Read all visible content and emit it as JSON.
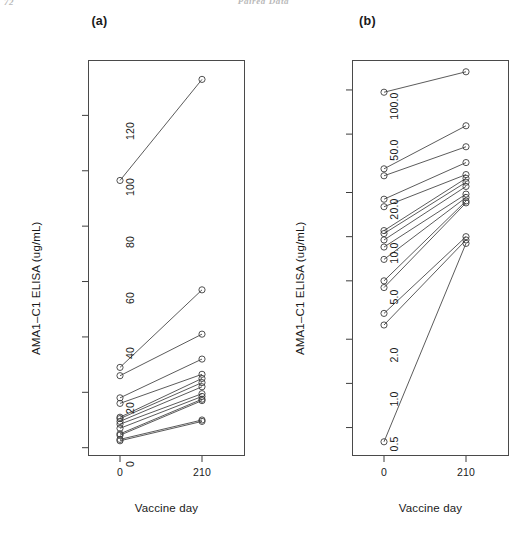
{
  "page_header": {
    "left": "72",
    "center": "Paired Data"
  },
  "figure": {
    "panels": [
      {
        "key": "a",
        "label": "(a)",
        "xlabel": "Vaccine day",
        "ylabel": "AMA1–C1 ELISA (ug/mL)",
        "yscale": "linear",
        "yticks": [
          "0",
          "20",
          "40",
          "60",
          "80",
          "100",
          "120"
        ],
        "xticks": [
          "0",
          "210"
        ]
      },
      {
        "key": "b",
        "label": "(b)",
        "xlabel": "Vaccine day",
        "ylabel": "AMA1–C1 ELISA (ug/mL)",
        "yscale": "log",
        "yticks": [
          "0.5",
          "1.0",
          "2.0",
          "5.0",
          "10.0",
          "20.0",
          "50.0",
          "100.0"
        ],
        "xticks": [
          "0",
          "210"
        ]
      }
    ]
  },
  "chart_data": [
    {
      "type": "line",
      "title": "(a)",
      "subtitle": "",
      "xlabel": "Vaccine day",
      "ylabel": "AMA1-C1 ELISA (ug/mL)",
      "x": [
        0,
        210
      ],
      "xtick_labels": [
        "0",
        "210"
      ],
      "ytick_values": [
        0,
        20,
        40,
        60,
        80,
        100,
        120
      ],
      "ytick_labels": [
        "0",
        "20",
        "40",
        "60",
        "80",
        "100",
        "120"
      ],
      "ylim": [
        -3,
        140
      ],
      "yscale": "linear",
      "grid": false,
      "legend": "none",
      "marker": "open-circle",
      "series": [
        {
          "name": "subject-1",
          "values": [
            96.5,
            133.0
          ]
        },
        {
          "name": "subject-2",
          "values": [
            29.0,
            57.0
          ]
        },
        {
          "name": "subject-3",
          "values": [
            26.0,
            41.0
          ]
        },
        {
          "name": "subject-4",
          "values": [
            18.0,
            32.0
          ]
        },
        {
          "name": "subject-5",
          "values": [
            16.0,
            26.5
          ]
        },
        {
          "name": "subject-6",
          "values": [
            11.0,
            25.0
          ]
        },
        {
          "name": "subject-7",
          "values": [
            10.5,
            23.5
          ]
        },
        {
          "name": "subject-8",
          "values": [
            9.5,
            22.0
          ]
        },
        {
          "name": "subject-9",
          "values": [
            8.5,
            19.5
          ]
        },
        {
          "name": "subject-10",
          "values": [
            7.0,
            18.5
          ]
        },
        {
          "name": "subject-11",
          "values": [
            5.0,
            17.5
          ]
        },
        {
          "name": "subject-12",
          "values": [
            4.5,
            17.0
          ]
        },
        {
          "name": "subject-13",
          "values": [
            3.0,
            10.0
          ]
        },
        {
          "name": "subject-14",
          "values": [
            2.5,
            9.5
          ]
        }
      ]
    },
    {
      "type": "line",
      "title": "(b)",
      "subtitle": "",
      "xlabel": "Vaccine day",
      "ylabel": "AMA1-C1 ELISA (ug/mL)",
      "x": [
        0,
        210
      ],
      "xtick_labels": [
        "0",
        "210"
      ],
      "ytick_values": [
        0.5,
        1.0,
        2.0,
        5.0,
        10.0,
        20.0,
        50.0,
        100.0
      ],
      "ytick_labels": [
        "0.5",
        "1.0",
        "2.0",
        "5.0",
        "10.0",
        "20.0",
        "50.0",
        "100.0"
      ],
      "ylim": [
        0.32,
        160
      ],
      "yscale": "log",
      "grid": false,
      "legend": "none",
      "marker": "open-circle",
      "series": [
        {
          "name": "subject-1",
          "values": [
            96.5,
            133.0
          ]
        },
        {
          "name": "subject-2",
          "values": [
            29.0,
            57.0
          ]
        },
        {
          "name": "subject-3",
          "values": [
            26.0,
            41.0
          ]
        },
        {
          "name": "subject-4",
          "values": [
            18.0,
            32.0
          ]
        },
        {
          "name": "subject-5",
          "values": [
            16.0,
            26.5
          ]
        },
        {
          "name": "subject-6",
          "values": [
            11.0,
            25.0
          ]
        },
        {
          "name": "subject-7",
          "values": [
            10.5,
            23.5
          ]
        },
        {
          "name": "subject-8",
          "values": [
            9.5,
            22.0
          ]
        },
        {
          "name": "subject-9",
          "values": [
            8.5,
            19.5
          ]
        },
        {
          "name": "subject-10",
          "values": [
            7.0,
            18.5
          ]
        },
        {
          "name": "subject-11",
          "values": [
            5.0,
            17.5
          ]
        },
        {
          "name": "subject-12",
          "values": [
            4.5,
            17.0
          ]
        },
        {
          "name": "subject-13",
          "values": [
            3.0,
            10.0
          ]
        },
        {
          "name": "subject-14",
          "values": [
            2.5,
            9.5
          ]
        },
        {
          "name": "subject-15",
          "values": [
            0.4,
            9.0
          ]
        }
      ]
    }
  ]
}
